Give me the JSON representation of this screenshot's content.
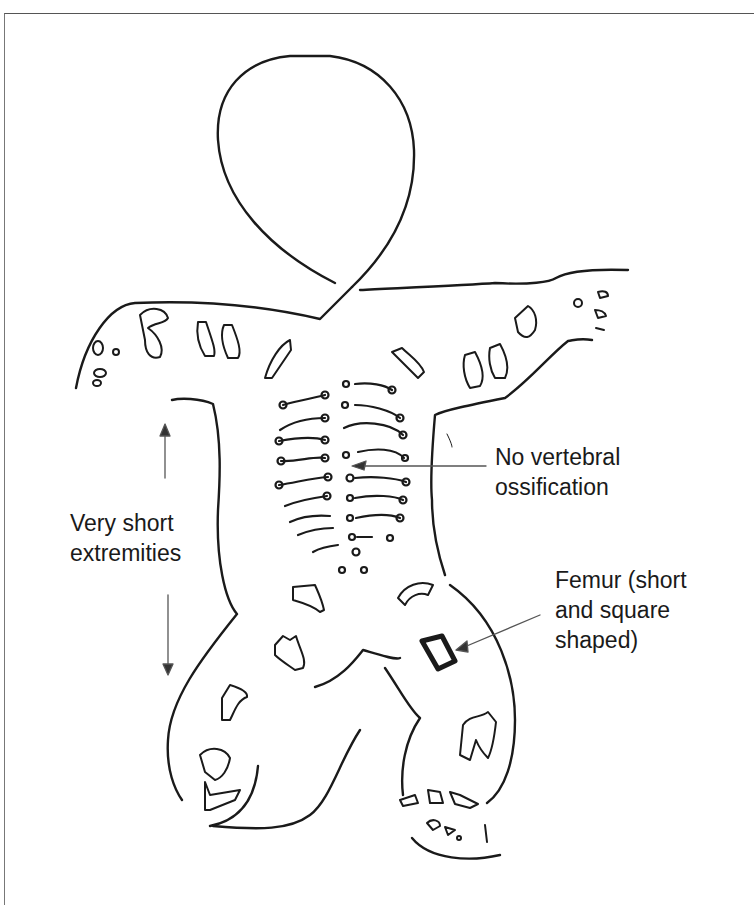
{
  "figure": {
    "annotations": [
      {
        "id": "vertebral",
        "lines": [
          "No vertebral",
          "ossification"
        ]
      },
      {
        "id": "extremities",
        "lines": [
          "Very short",
          "extremities"
        ]
      },
      {
        "id": "femur",
        "lines": [
          "Femur (short",
          "and square",
          "shaped)"
        ]
      }
    ]
  },
  "colors": {
    "ink": "#1a1a1a",
    "background": "#ffffff",
    "frame": "#555555"
  }
}
